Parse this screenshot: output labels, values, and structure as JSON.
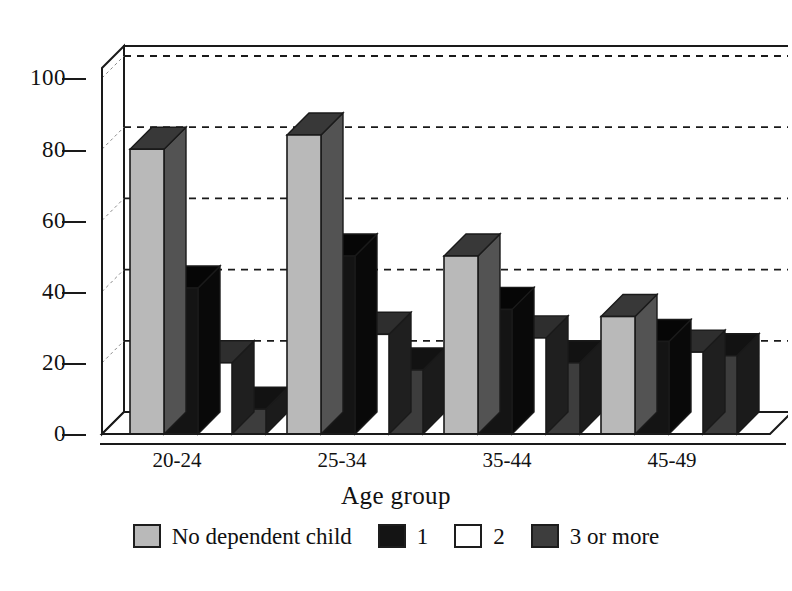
{
  "figure": {
    "title_remnant": "· · ·  ·· ···· ·· ·· · ······ ·   ·· ·· ·· ·",
    "background": "#ffffff",
    "ink": "#1a1a1a"
  },
  "chart_data": {
    "type": "bar",
    "title": "",
    "subtitle": "",
    "xlabel": "Age group",
    "ylabel": "",
    "categories": [
      "20-24",
      "25-34",
      "35-44",
      "45-49"
    ],
    "series": [
      {
        "name": "No dependent child",
        "color": "#b9b9b9",
        "values": [
          80,
          84,
          50,
          33
        ]
      },
      {
        "name": "1",
        "color": "#141414",
        "values": [
          41,
          50,
          35,
          26
        ]
      },
      {
        "name": "2",
        "color": "#ffffff",
        "values": [
          20,
          28,
          27,
          23
        ]
      },
      {
        "name": "3 or more",
        "color": "#3d3d3d",
        "values": [
          7,
          18,
          20,
          22
        ]
      }
    ],
    "ylim": [
      0,
      100
    ],
    "yticks": [
      0,
      20,
      40,
      60,
      80,
      100
    ],
    "ytick_labels": [
      "0",
      "20",
      "40",
      "60",
      "80",
      "100"
    ],
    "grid": true,
    "grid_style": "dashed-horizontal",
    "legend_position": "bottom-center",
    "style": "3d-shadow-bars"
  },
  "legend": {
    "entries": [
      {
        "label": "No dependent child",
        "swatch_color": "#b9b9b9"
      },
      {
        "label": "1",
        "swatch_color": "#141414"
      },
      {
        "label": "2",
        "swatch_color": "#ffffff"
      },
      {
        "label": "3 or more",
        "swatch_color": "#3d3d3d"
      }
    ]
  },
  "axes": {
    "y_tick_labels": [
      "100",
      "80",
      "60",
      "40",
      "20",
      "0"
    ],
    "x_tick_labels": [
      "20-24",
      "25-34",
      "35-44",
      "45-49"
    ],
    "x_title": "Age group"
  }
}
